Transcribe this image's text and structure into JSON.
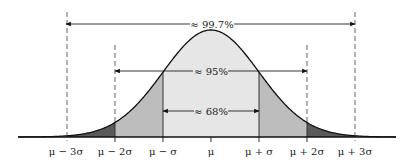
{
  "diagram": {
    "regions": [
      {
        "label": "≈ 68%",
        "from": "μ − σ",
        "to": "μ + σ",
        "color": "#e6e6e6"
      },
      {
        "label": "≈ 95%",
        "from": "μ − 2σ",
        "to": "μ + 2σ",
        "color": "#bdbdbd"
      },
      {
        "label": "≈ 99.7%",
        "from": "μ − 3σ",
        "to": "μ + 3σ",
        "color": "#5a5a5a"
      }
    ],
    "axis_labels": [
      "μ − 3σ",
      "μ − 2σ",
      "μ − σ",
      "μ",
      "μ + σ",
      "μ + 2σ",
      "μ + 3σ"
    ],
    "colors": {
      "inner": "#e6e6e6",
      "middle": "#bdbdbd",
      "outer": "#5a5a5a",
      "curve": "#111111",
      "dash": "#666666"
    }
  }
}
